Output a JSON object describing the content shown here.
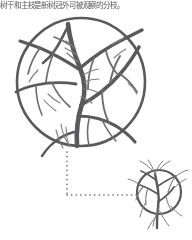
{
  "caption": {
    "text": "树干和主枝是新树冠外可被观察的分枝。"
  },
  "colors": {
    "stroke_primary": "#5a5a5c",
    "stroke_secondary": "#6e6e70",
    "stroke_hair": "#7e7e80",
    "connector": "#6b6b6d",
    "background": "#ffffff",
    "caption_text": "#3d3d3d"
  },
  "figures": {
    "main": {
      "name": "large-circular-tree-diagram",
      "shape": "circle",
      "description": "Bare deciduous tree with trunk and branching limbs enclosed in a circular crown outline",
      "circle": {
        "cx": 67,
        "cy": 70,
        "r": 64
      }
    },
    "detail": {
      "name": "small-circular-tree-diagram",
      "shape": "circle",
      "description": "Small whole-tree view with circular crown outline and trunk below",
      "circle": {
        "cx": 33,
        "cy": 34,
        "r": 22
      }
    }
  },
  "connector": {
    "name": "dotted-callout-line",
    "style": "dotted",
    "path": "vertical-then-horizontal",
    "from": "main-figure-bottom",
    "to": "detail-figure-left"
  }
}
